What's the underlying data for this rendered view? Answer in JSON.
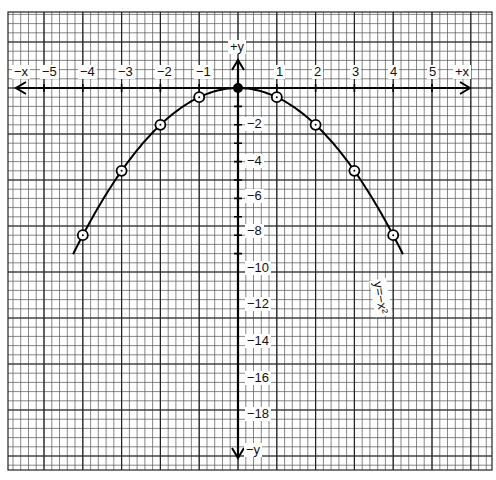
{
  "chart_data": {
    "type": "line",
    "title": "",
    "equation_label": "y=−x²",
    "xlabel_pos": "+x",
    "xlabel_neg": "−x",
    "ylabel_pos": "+y",
    "ylabel_neg": "−y",
    "x_ticks": [
      -5,
      -4,
      -3,
      -2,
      -1,
      1,
      2,
      3,
      4,
      5
    ],
    "x_tick_labels": [
      "−5",
      "−4",
      "−3",
      "−2",
      "−1",
      "1",
      "2",
      "3",
      "4",
      "5"
    ],
    "y_ticks": [
      -2,
      -4,
      -6,
      -8,
      -10,
      -12,
      -14,
      -16,
      -18
    ],
    "y_tick_labels": [
      "−2",
      "−4",
      "−6",
      "−8",
      "−10",
      "−12",
      "−14",
      "−16",
      "−18"
    ],
    "xlim": [
      -6,
      6
    ],
    "ylim": [
      -20,
      2
    ],
    "grid": true,
    "series": [
      {
        "name": "y=−x²",
        "x": [
          -4,
          -3,
          -2,
          -1,
          0,
          1,
          2,
          3,
          4
        ],
        "y": [
          -16,
          -9,
          -4,
          -1,
          0,
          -1,
          -4,
          -9,
          -16
        ],
        "marker": "circle"
      }
    ]
  },
  "geometry": {
    "origin_px": [
      238,
      88
    ],
    "x_unit_px": 38.8,
    "y_unit_px": 9.2,
    "grid_left": 8,
    "grid_right": 492,
    "grid_top": 12,
    "grid_bottom": 470
  }
}
